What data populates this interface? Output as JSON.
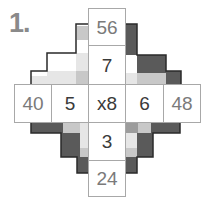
{
  "puzzle": {
    "number_label": "1.",
    "operator_label": "x8",
    "top": [
      "56",
      "7"
    ],
    "bottom": [
      "3",
      "24"
    ],
    "left": [
      "40",
      "5"
    ],
    "right": [
      "6",
      "48"
    ]
  },
  "colors": {
    "dark": "#5a5a5a",
    "mid": "#9c9c9c",
    "light": "#c8c8c8",
    "pale": "#e6e6e6",
    "grid": "#a8a8a8",
    "title": "#8a8a8a"
  }
}
